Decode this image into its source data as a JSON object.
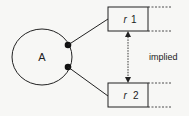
{
  "diagram": {
    "entity": {
      "label": "A",
      "shape": "ellipse"
    },
    "relations": [
      {
        "id": "r1",
        "prefix": "r",
        "number": "1"
      },
      {
        "id": "r2",
        "prefix": "r",
        "number": "2"
      }
    ],
    "connector": {
      "label": "implied",
      "style": "dashed",
      "arrows": "both"
    },
    "colors": {
      "stroke": "#222222",
      "background": "#f7f7f5"
    }
  }
}
